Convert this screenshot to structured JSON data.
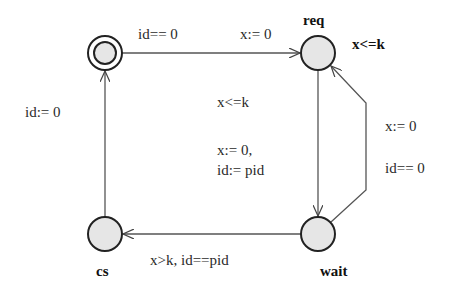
{
  "diagram": {
    "type": "timed-automaton",
    "locations": [
      {
        "id": "init",
        "name": "",
        "initial": true,
        "x": 105,
        "y": 53
      },
      {
        "id": "req",
        "name": "req",
        "invariant": "x<=k",
        "x": 318,
        "y": 53
      },
      {
        "id": "wait",
        "name": "wait",
        "invariant": "x<=k",
        "x": 318,
        "y": 234
      },
      {
        "id": "cs",
        "name": "cs",
        "x": 105,
        "y": 234
      }
    ],
    "edges": [
      {
        "from": "init",
        "to": "req",
        "guard": "id== 0",
        "update": "x:= 0"
      },
      {
        "from": "req",
        "to": "wait",
        "update_line1": "x:= 0,",
        "update_line2": "id:= pid"
      },
      {
        "from": "wait",
        "to": "req",
        "update": "x:= 0",
        "guard": "id== 0"
      },
      {
        "from": "wait",
        "to": "cs",
        "guard": "x>k, id==pid"
      },
      {
        "from": "cs",
        "to": "init",
        "update": "id:= 0"
      }
    ]
  },
  "labels": {
    "req_name": "req",
    "req_invariant": "x<=k",
    "wait_name": "wait",
    "cs_name": "cs",
    "top_guard": "id== 0",
    "top_update": "x:= 0",
    "center_invariant": "x<=k",
    "center_update1": "x:= 0,",
    "center_update2": "id:= pid",
    "right_update": "x:= 0",
    "right_guard": "id== 0",
    "bottom_guard": "x>k, id==pid",
    "left_update": "id:= 0"
  },
  "colors": {
    "node_fill": "#e6e6e6",
    "stroke": "#222222",
    "edge": "#555555"
  }
}
